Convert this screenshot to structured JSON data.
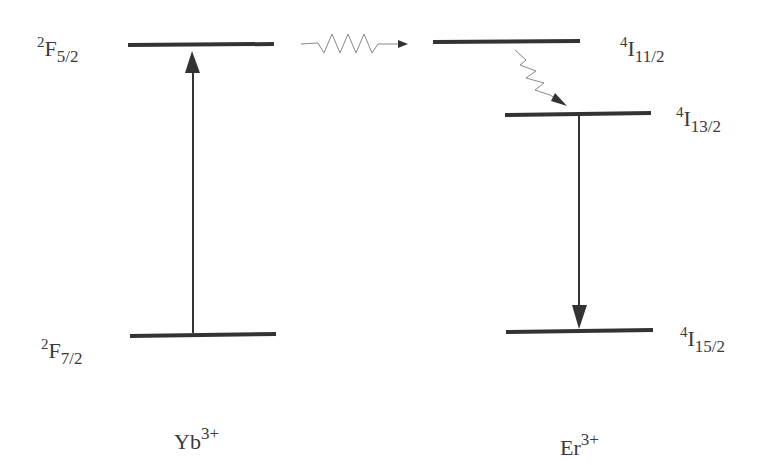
{
  "diagram": {
    "type": "energy-level-diagram",
    "colors": {
      "level_line": "#333333",
      "arrow": "#333333",
      "wavy_arrow": "#777777",
      "text": "#3a3a3a"
    },
    "ions": [
      {
        "id": "yb",
        "base": "Yb",
        "charge": "3+",
        "levels": [
          {
            "id": "yb-2F5-2",
            "sup": "2",
            "term": "F",
            "sub": "5/2"
          },
          {
            "id": "yb-2F7-2",
            "sup": "2",
            "term": "F",
            "sub": "7/2"
          }
        ]
      },
      {
        "id": "er",
        "base": "Er",
        "charge": "3+",
        "levels": [
          {
            "id": "er-4I11-2",
            "sup": "4",
            "term": "I",
            "sub": "11/2"
          },
          {
            "id": "er-4I13-2",
            "sup": "4",
            "term": "I",
            "sub": "13/2"
          },
          {
            "id": "er-4I15-2",
            "sup": "4",
            "term": "I",
            "sub": "15/2"
          }
        ]
      }
    ],
    "transitions": [
      {
        "from": "yb-2F7-2",
        "to": "yb-2F5-2",
        "style": "solid",
        "meaning": "absorption"
      },
      {
        "from": "yb-2F5-2",
        "to": "er-4I11-2",
        "style": "wavy",
        "meaning": "energy transfer"
      },
      {
        "from": "er-4I11-2",
        "to": "er-4I13-2",
        "style": "wavy",
        "meaning": "non-radiative relaxation"
      },
      {
        "from": "er-4I13-2",
        "to": "er-4I15-2",
        "style": "solid",
        "meaning": "emission"
      }
    ]
  }
}
